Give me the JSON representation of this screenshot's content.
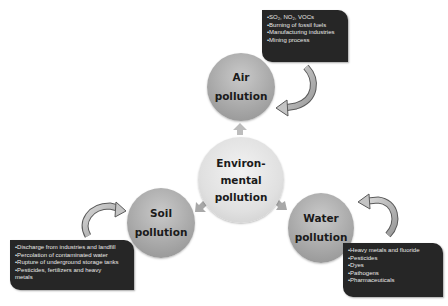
{
  "diagram": {
    "center": {
      "lines": [
        "Environ-",
        "mental",
        "pollution"
      ]
    },
    "nodes": {
      "air": {
        "lines": [
          "Air",
          "pollution"
        ],
        "sources": [
          "SO₂, NO₂, VOCs",
          "Burning of fossil fuels",
          "Manufacturing industries",
          "Mining process"
        ]
      },
      "soil": {
        "lines": [
          "Soil",
          "pollution"
        ],
        "sources": [
          "Discharge from industries and landfill",
          "Percolation of contaminated water",
          "Rupture of  underground storage tanks",
          "Pesticides, fertilizers and heavy",
          "metals"
        ]
      },
      "water": {
        "lines": [
          "Water",
          "pollution"
        ],
        "sources": [
          "Heavy metals and fluoride",
          "Pesticides",
          "Dyes",
          "Pathogens",
          "Pharmaceuticals"
        ]
      }
    },
    "colors": {
      "outer_circle": "#a9a9a9",
      "center_circle": "#e0e0e0",
      "box_background": "#262626",
      "box_text": "#e8e8e8",
      "arrow_fill": "#b0b0b0"
    }
  }
}
